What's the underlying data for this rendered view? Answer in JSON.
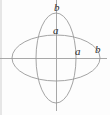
{
  "figure": {
    "background_color": "#fdfdfd",
    "curve_color": "#9a9a9a",
    "axis_color": "#a8a8a8",
    "label_color": "#2e2e2e",
    "origin": {
      "x": 56,
      "y": 58
    },
    "labels": {
      "b_top": "b",
      "a_top": "a",
      "a_right": "a",
      "b_right": "b"
    }
  },
  "chart_data": {
    "type": "scatter",
    "title": "",
    "xlabel": "",
    "ylabel": "",
    "grid": false,
    "legend": null,
    "axes": {
      "horizontal": {
        "y": 58,
        "x_start": 0,
        "x_end": 107
      },
      "vertical": {
        "x": 56,
        "y_start": 0,
        "y_end": 111
      }
    },
    "series": [
      {
        "name": "horizontal-ellipse",
        "shape": "ellipse",
        "cx": 56,
        "cy": 58,
        "rx": 44,
        "ry": 23,
        "semi_major_label": "b",
        "semi_minor_label": "a"
      },
      {
        "name": "vertical-ellipse",
        "shape": "ellipse",
        "cx": 56,
        "cy": 58,
        "rx": 20,
        "ry": 45,
        "semi_major_label": "b",
        "semi_minor_label": "a"
      }
    ],
    "annotations": [
      {
        "text": "b",
        "x": 58,
        "y": 8,
        "meaning": "vertical-ellipse-semi-major-top"
      },
      {
        "text": "a",
        "x": 57,
        "y": 31,
        "meaning": "horizontal-ellipse-semi-minor-top"
      },
      {
        "text": "a",
        "x": 79,
        "y": 52,
        "meaning": "vertical-ellipse-semi-minor-right"
      },
      {
        "text": "b",
        "x": 99,
        "y": 50,
        "meaning": "horizontal-ellipse-semi-major-right"
      }
    ]
  }
}
